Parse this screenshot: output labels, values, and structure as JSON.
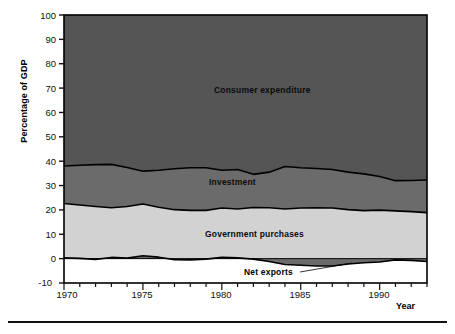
{
  "chart_data": {
    "type": "area",
    "stacked": true,
    "title": "",
    "xlabel": "Year",
    "ylabel": "Percentage of GDP",
    "xlim": [
      1970,
      1993
    ],
    "ylim": [
      -10,
      100
    ],
    "ytick_values": [
      -10,
      0,
      10,
      20,
      30,
      40,
      50,
      60,
      70,
      80,
      90,
      100
    ],
    "xtick_labels": [
      "1970",
      "1975",
      "1980",
      "1985",
      "1990"
    ],
    "xtick_values": [
      1970,
      1975,
      1980,
      1985,
      1990
    ],
    "minor_x_ticks_every": 1,
    "grid": false,
    "legend": "in-plot labels",
    "x": [
      1970,
      1971,
      1972,
      1973,
      1974,
      1975,
      1976,
      1977,
      1978,
      1979,
      1980,
      1981,
      1982,
      1983,
      1984,
      1985,
      1986,
      1987,
      1988,
      1989,
      1990,
      1991,
      1992,
      1993
    ],
    "series": [
      {
        "name": "Net exports",
        "color": "#6b6b6b",
        "values": [
          0.3,
          0.1,
          -0.3,
          0.5,
          0.2,
          1.2,
          0.6,
          -0.4,
          -0.5,
          -0.2,
          0.5,
          0.3,
          -0.2,
          -1.2,
          -2.4,
          -2.7,
          -3.0,
          -3.0,
          -2.2,
          -1.7,
          -1.4,
          -0.5,
          -0.7,
          -1.2
        ]
      },
      {
        "name": "Government purchases",
        "color": "#d2d2d2",
        "values": [
          22.3,
          21.9,
          21.4,
          20.4,
          21.2,
          21.2,
          20.5,
          20.1,
          19.8,
          19.8,
          20.3,
          20.1,
          21.0,
          20.9,
          20.4,
          20.8,
          20.9,
          20.8,
          20.1,
          19.7,
          19.9,
          19.6,
          19.3,
          18.9
        ]
      },
      {
        "name": "Investment",
        "color": "#6b6b6b",
        "values": [
          15.4,
          16.3,
          17.2,
          17.8,
          16.0,
          13.5,
          15.2,
          16.8,
          17.5,
          17.5,
          15.5,
          16.2,
          13.6,
          14.6,
          17.4,
          16.5,
          16.1,
          15.8,
          15.4,
          15.1,
          13.8,
          12.4,
          12.8,
          13.4
        ]
      },
      {
        "name": "Consumer expenditure",
        "color": "#555555",
        "values": [
          62.0,
          61.7,
          61.7,
          61.3,
          62.6,
          64.1,
          63.7,
          63.5,
          63.2,
          62.9,
          63.7,
          63.4,
          65.6,
          65.7,
          64.6,
          65.4,
          66.0,
          66.4,
          66.7,
          66.9,
          67.7,
          68.5,
          68.6,
          68.9
        ]
      }
    ],
    "series_labels": [
      {
        "name": "Consumer expenditure",
        "text": "Consumer expenditure"
      },
      {
        "name": "Investment",
        "text": "Investment"
      },
      {
        "name": "Government purchases",
        "text": "Government purchases"
      },
      {
        "name": "Net exports",
        "text": "Net exports"
      }
    ]
  },
  "axes": {
    "y_title": "Percentage of GDP",
    "x_title": "Year",
    "y_ticks": [
      "100",
      "90",
      "80",
      "70",
      "60",
      "50",
      "40",
      "30",
      "20",
      "10",
      "0",
      "-10"
    ],
    "x_ticks": [
      "1970",
      "1975",
      "1980",
      "1985",
      "1990"
    ]
  },
  "labels": {
    "consumer": "Consumer expenditure",
    "investment": "Investment",
    "government": "Government purchases",
    "net_exports": "Net exports"
  },
  "colors": {
    "consumer": "#555555",
    "investment": "#6b6b6b",
    "government": "#d2d2d2",
    "net_exports": "#6b6b6b",
    "axis": "#111111",
    "plot_border": "#000000"
  }
}
